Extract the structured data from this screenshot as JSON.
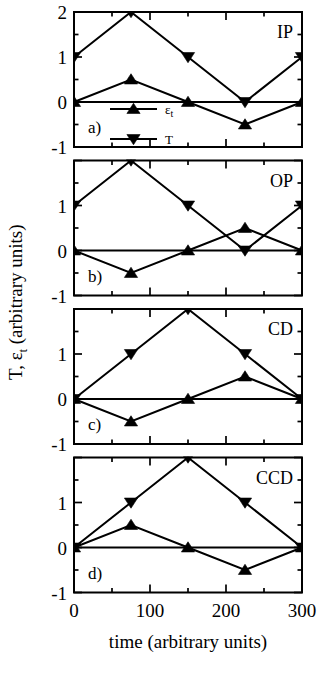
{
  "chart_data": {
    "type": "line",
    "title": "",
    "xlabel": "time (arbitrary units)",
    "ylabel": "T, ε",
    "ylabel_sub": "t",
    "ylabel_suffix": " (arbitrary units)",
    "x": [
      0,
      75,
      150,
      225,
      300
    ],
    "xlim": [
      0,
      300
    ],
    "xticks": [
      0,
      100,
      200,
      300
    ],
    "xtick_labels": [
      "0",
      "100",
      "200",
      "300"
    ],
    "xminor_step": 50,
    "grid": false,
    "legend_position": "inside-lower-left-panel-a",
    "legend": [
      {
        "name": "ε",
        "sub": "t",
        "marker": "up-triangle"
      },
      {
        "name": "T",
        "sub": "",
        "marker": "down-triangle"
      }
    ],
    "panels": [
      {
        "id": "a",
        "letter": "a)",
        "tag": "IP",
        "ylim": [
          -1,
          2
        ],
        "yticks": [
          -1,
          0,
          1,
          2
        ],
        "ytick_labels": [
          "-1",
          "0",
          "1",
          "2"
        ],
        "yminor_step": 0.5,
        "series": [
          {
            "name": "T",
            "marker": "down-triangle",
            "values": [
              1,
              2,
              1,
              0,
              1
            ]
          },
          {
            "name": "εt",
            "marker": "up-triangle",
            "values": [
              0,
              0.5,
              0,
              -0.5,
              0
            ]
          }
        ]
      },
      {
        "id": "b",
        "letter": "b)",
        "tag": "OP",
        "ylim": [
          -1,
          2
        ],
        "yticks": [
          -1,
          0,
          1
        ],
        "ytick_labels": [
          "-1",
          "0",
          "1"
        ],
        "yminor_step": 0.5,
        "series": [
          {
            "name": "T",
            "marker": "down-triangle",
            "values": [
              1,
              2,
              1,
              0,
              1
            ]
          },
          {
            "name": "εt",
            "marker": "up-triangle",
            "values": [
              0,
              -0.5,
              0,
              0.5,
              0
            ]
          }
        ]
      },
      {
        "id": "c",
        "letter": "c)",
        "tag": "CD",
        "ylim": [
          -1,
          2
        ],
        "yticks": [
          -1,
          0,
          1
        ],
        "ytick_labels": [
          "-1",
          "0",
          "1"
        ],
        "yminor_step": 0.5,
        "series": [
          {
            "name": "T",
            "marker": "down-triangle",
            "values": [
              0,
              1,
              2,
              1,
              0
            ]
          },
          {
            "name": "εt",
            "marker": "up-triangle",
            "values": [
              0,
              -0.5,
              0,
              0.5,
              0
            ]
          }
        ]
      },
      {
        "id": "d",
        "letter": "d)",
        "tag": "CCD",
        "ylim": [
          -1,
          2
        ],
        "yticks": [
          -1,
          0,
          1
        ],
        "ytick_labels": [
          "-1",
          "0",
          "1"
        ],
        "yminor_step": 0.5,
        "series": [
          {
            "name": "T",
            "marker": "down-triangle",
            "values": [
              0,
              1,
              2,
              1,
              0
            ]
          },
          {
            "name": "εt",
            "marker": "up-triangle",
            "values": [
              0,
              0.5,
              0,
              -0.5,
              0
            ]
          }
        ]
      }
    ],
    "colors": {
      "line": "#000000",
      "marker": "#000000",
      "axis": "#000000",
      "background": "#ffffff"
    }
  }
}
